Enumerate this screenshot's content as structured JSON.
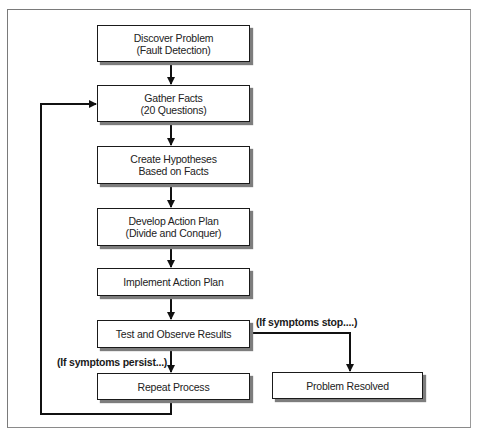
{
  "diagram": {
    "nodes": [
      {
        "id": "discover",
        "line1": "Discover Problem",
        "line2": "(Fault Detection)"
      },
      {
        "id": "gather",
        "line1": "Gather Facts",
        "line2": "(20 Questions)"
      },
      {
        "id": "hypotheses",
        "line1": "Create Hypotheses",
        "line2": "Based on Facts"
      },
      {
        "id": "plan",
        "line1": "Develop Action Plan",
        "line2": "(Divide and Conquer)"
      },
      {
        "id": "implement",
        "line1": "Implement Action Plan",
        "line2": ""
      },
      {
        "id": "test",
        "line1": "Test and Observe Results",
        "line2": ""
      },
      {
        "id": "repeat",
        "line1": "Repeat Process",
        "line2": ""
      },
      {
        "id": "resolved",
        "line1": "Problem Resolved",
        "line2": ""
      }
    ],
    "edge_labels": {
      "stop": "(If symptoms stop....)",
      "persist": "(If symptoms persist...)"
    },
    "edges": [
      {
        "from": "discover",
        "to": "gather"
      },
      {
        "from": "gather",
        "to": "hypotheses"
      },
      {
        "from": "hypotheses",
        "to": "plan"
      },
      {
        "from": "plan",
        "to": "implement"
      },
      {
        "from": "implement",
        "to": "test"
      },
      {
        "from": "test",
        "to": "repeat",
        "label": "(If symptoms persist...)"
      },
      {
        "from": "test",
        "to": "resolved",
        "label": "(If symptoms stop....)"
      },
      {
        "from": "repeat",
        "to": "gather"
      }
    ]
  }
}
